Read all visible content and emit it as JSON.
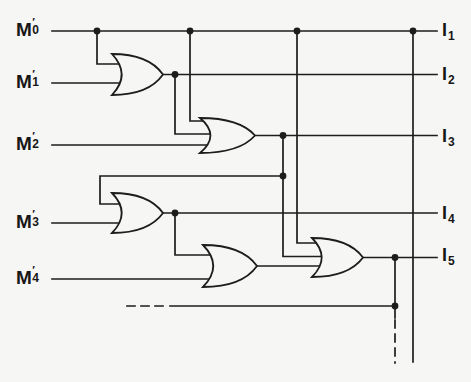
{
  "figure": {
    "kind": "logic-circuit-diagram",
    "gate_type": "OR",
    "gate_count": 5,
    "line_color": "#1d1d1d",
    "background_color": "#f6f6f4"
  },
  "inputs": [
    {
      "letter": "M",
      "prime": "′",
      "sub": "0"
    },
    {
      "letter": "M",
      "prime": "′",
      "sub": "1"
    },
    {
      "letter": "M",
      "prime": "′",
      "sub": "2"
    },
    {
      "letter": "M",
      "prime": "′",
      "sub": "3"
    },
    {
      "letter": "M",
      "prime": "′",
      "sub": "4"
    }
  ],
  "outputs": [
    {
      "letter": "I",
      "sub": "1"
    },
    {
      "letter": "I",
      "sub": "2"
    },
    {
      "letter": "I",
      "sub": "3"
    },
    {
      "letter": "I",
      "sub": "4"
    },
    {
      "letter": "I",
      "sub": "5"
    }
  ]
}
